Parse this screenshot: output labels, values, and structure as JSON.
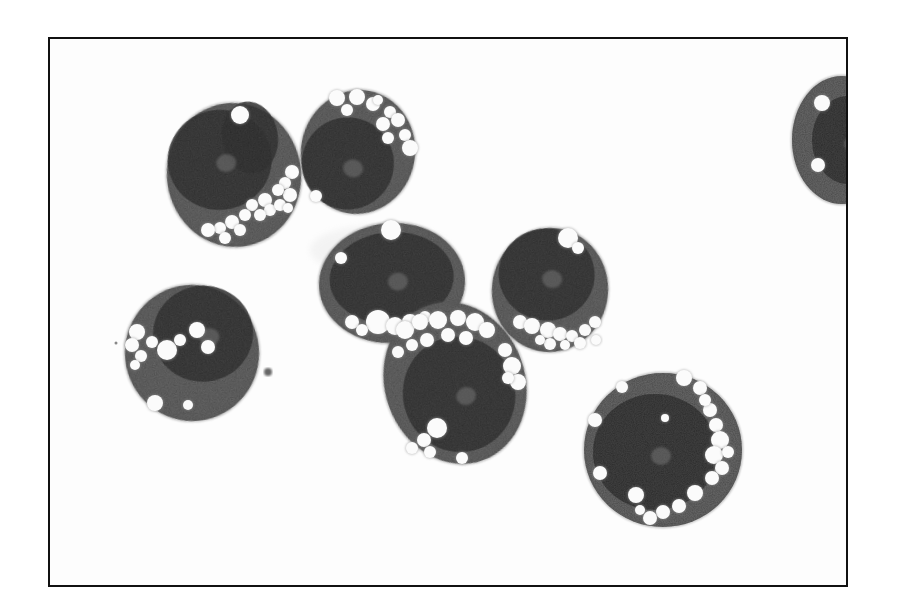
{
  "figure": {
    "kind": "grayscale light micrograph",
    "caption": null,
    "palette": {
      "background": "#fdfdfd",
      "frame": "#111111",
      "cytoplasm": "#6a6a6a",
      "nucleus": "#3e3e3e",
      "vacuole": "#fbfbfb"
    }
  },
  "cells": [
    {
      "id": "cell-upper-left",
      "vacuole_cluster": "lower-right",
      "vacuole_count_approx": 16,
      "partially_visible": false
    },
    {
      "id": "cell-upper-center",
      "vacuole_cluster": "upper-right",
      "vacuole_count_approx": 12,
      "partially_visible": false
    },
    {
      "id": "cell-center",
      "vacuole_cluster": "lower",
      "vacuole_count_approx": 6,
      "partially_visible": false
    },
    {
      "id": "cell-center-right",
      "vacuole_cluster": "lower",
      "vacuole_count_approx": 12,
      "partially_visible": false
    },
    {
      "id": "cell-left",
      "vacuole_cluster": "upper-left",
      "vacuole_count_approx": 9,
      "partially_visible": false
    },
    {
      "id": "cell-lower-center",
      "vacuole_cluster": "upper-and-rim",
      "vacuole_count_approx": 18,
      "partially_visible": false
    },
    {
      "id": "cell-lower-right",
      "vacuole_cluster": "rim",
      "vacuole_count_approx": 20,
      "partially_visible": false
    },
    {
      "id": "cell-edge-right",
      "vacuole_cluster": "left",
      "vacuole_count_approx": 2,
      "partially_visible": true
    }
  ]
}
